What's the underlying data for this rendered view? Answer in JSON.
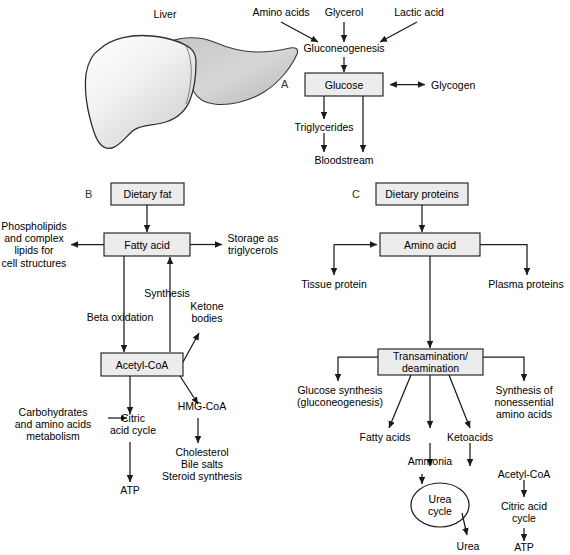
{
  "figure": {
    "organ": {
      "label": "Liver"
    },
    "panels": [
      {
        "id": "A",
        "letter": "A",
        "name": "carbohydrate-metabolism"
      },
      {
        "id": "B",
        "letter": "B",
        "name": "fat-metabolism"
      },
      {
        "id": "C",
        "letter": "C",
        "name": "protein-metabolism"
      }
    ],
    "panel_a": {
      "inputs": [
        "Amino acids",
        "Glycerol",
        "Lactic acid"
      ],
      "process": "Gluconeogenesis",
      "box": "Glucose",
      "store": "Glycogen",
      "outputs": [
        "Triglycerides",
        "Bloodstream"
      ]
    },
    "panel_b": {
      "source_box": "Dietary fat",
      "hub_box": "Fatty acid",
      "left_output": "Phospholipids\nand complex\nlipids for\ncell structures",
      "right_output": "Storage as\ntriglycerols",
      "down_path": "Beta oxidation",
      "up_path": "Synthesis",
      "ketones": "Ketone\nbodies",
      "acetyl_box": "Acetyl-CoA",
      "hmg": "HMG-CoA",
      "sterols": "Cholesterol\nBile salts\nSteroid synthesis",
      "carbs_in": "Carbohydrates\nand amino acids\nmetabolism",
      "citric": "Citric\nacid cycle",
      "atp": "ATP"
    },
    "panel_c": {
      "source_box": "Dietary proteins",
      "hub_box": "Amino acid",
      "tissue": "Tissue protein",
      "plasma": "Plasma proteins",
      "transam_box": "Transamination/\ndeamination",
      "gluconeo": "Glucose synthesis\n(gluconeogenesis)",
      "nonessential": "Synthesis of\nnonessential\namino acids",
      "fatty_acids": "Fatty acids",
      "ketoacids": "Ketoacids",
      "ammonia": "Ammonia",
      "urea_cycle": "Urea\ncycle",
      "urea": "Urea",
      "acetyl": "Acetyl-CoA",
      "citric": "Citric acid\ncycle",
      "atp": "ATP"
    },
    "style": {
      "box_fill": "#ececec",
      "box_stroke": "#2b2b2b",
      "line": "#1a1a1a",
      "liver_light": "#fbfbfb",
      "liver_mid": "#d8d8d8",
      "liver_dark": "#b9b9b9"
    }
  }
}
